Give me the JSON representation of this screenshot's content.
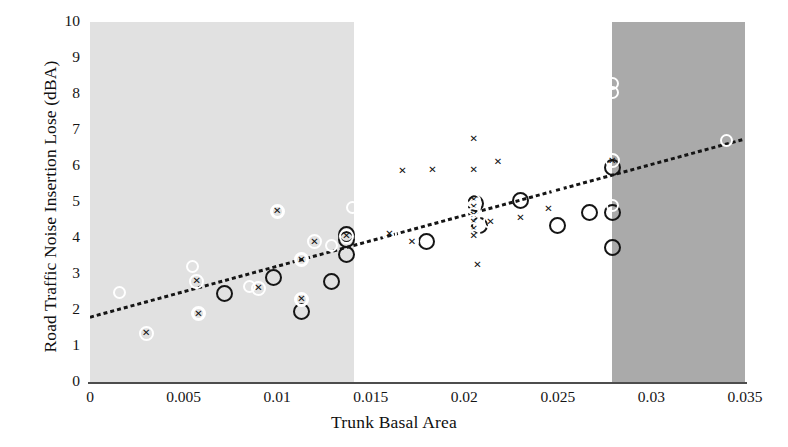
{
  "chart_data": {
    "type": "scatter",
    "title": "",
    "xlabel": "Trunk Basal Area",
    "ylabel": "Road Traffic Noise Insertion Lose (dBA)",
    "xlim": [
      0,
      0.035
    ],
    "ylim": [
      0,
      10
    ],
    "xticks": [
      "0",
      "0.005",
      "0.01",
      "0.015",
      "0.02",
      "0.025",
      "0.03",
      "0.035"
    ],
    "xtick_values": [
      0,
      0.005,
      0.01,
      0.015,
      0.02,
      0.025,
      0.03,
      0.035
    ],
    "yticks": [
      "0",
      "1",
      "2",
      "3",
      "4",
      "5",
      "6",
      "7",
      "8",
      "9",
      "10"
    ],
    "ytick_values": [
      0,
      1,
      2,
      3,
      4,
      5,
      6,
      7,
      8,
      9,
      10
    ],
    "grid": false,
    "legend": "none",
    "background_bands": [
      {
        "name": "light-band",
        "x_start": 0.0,
        "x_end": 0.0141,
        "color": "#e1e1e1"
      },
      {
        "name": "dark-band",
        "x_start": 0.0279,
        "x_end": 0.035,
        "color": "#aaaaaa"
      }
    ],
    "trendline": {
      "type": "dotted-linear",
      "x_start": 0.0,
      "y_start": 1.8,
      "x_end": 0.035,
      "y_end": 6.75,
      "slope": 141.4,
      "intercept": 1.8,
      "color": "#151515"
    },
    "series": [
      {
        "name": "open-black-circle",
        "marker": "large open circle",
        "color": "#151515",
        "points": [
          {
            "x": 0.0072,
            "y": 2.45
          },
          {
            "x": 0.0098,
            "y": 2.9
          },
          {
            "x": 0.0113,
            "y": 1.95
          },
          {
            "x": 0.0129,
            "y": 2.8
          },
          {
            "x": 0.0137,
            "y": 4.1
          },
          {
            "x": 0.0137,
            "y": 3.95
          },
          {
            "x": 0.0137,
            "y": 3.55
          },
          {
            "x": 0.018,
            "y": 3.9
          },
          {
            "x": 0.0206,
            "y": 4.95
          },
          {
            "x": 0.0208,
            "y": 4.35
          },
          {
            "x": 0.023,
            "y": 5.05
          },
          {
            "x": 0.025,
            "y": 4.35
          },
          {
            "x": 0.0267,
            "y": 4.7
          },
          {
            "x": 0.0279,
            "y": 5.95
          },
          {
            "x": 0.0279,
            "y": 4.7
          },
          {
            "x": 0.0279,
            "y": 3.75
          }
        ]
      },
      {
        "name": "open-white-circle",
        "marker": "small light circle",
        "color": "#ffffff",
        "points": [
          {
            "x": 0.0016,
            "y": 2.5
          },
          {
            "x": 0.0055,
            "y": 3.2
          },
          {
            "x": 0.0058,
            "y": 1.9
          },
          {
            "x": 0.0085,
            "y": 2.65
          },
          {
            "x": 0.01,
            "y": 4.75
          },
          {
            "x": 0.0113,
            "y": 2.3
          },
          {
            "x": 0.0113,
            "y": 3.4
          },
          {
            "x": 0.0129,
            "y": 3.8
          },
          {
            "x": 0.014,
            "y": 4.85
          },
          {
            "x": 0.025,
            "y": 5.35
          },
          {
            "x": 0.0279,
            "y": 8.3
          },
          {
            "x": 0.0279,
            "y": 8.05
          },
          {
            "x": 0.0279,
            "y": 4.9
          },
          {
            "x": 0.034,
            "y": 6.7
          }
        ]
      },
      {
        "name": "cross-x",
        "marker": "x",
        "color": "#121212",
        "points": [
          {
            "x": 0.003,
            "y": 1.35
          },
          {
            "x": 0.0057,
            "y": 2.8
          },
          {
            "x": 0.0058,
            "y": 1.9
          },
          {
            "x": 0.009,
            "y": 2.6
          },
          {
            "x": 0.01,
            "y": 4.75
          },
          {
            "x": 0.0113,
            "y": 2.3
          },
          {
            "x": 0.0113,
            "y": 3.4
          },
          {
            "x": 0.012,
            "y": 3.9
          },
          {
            "x": 0.0137,
            "y": 4.05
          },
          {
            "x": 0.0167,
            "y": 5.85
          },
          {
            "x": 0.0183,
            "y": 5.9
          },
          {
            "x": 0.0172,
            "y": 3.9
          },
          {
            "x": 0.016,
            "y": 4.1
          },
          {
            "x": 0.0205,
            "y": 6.75
          },
          {
            "x": 0.0205,
            "y": 5.9
          },
          {
            "x": 0.0218,
            "y": 6.1
          },
          {
            "x": 0.0207,
            "y": 3.25
          },
          {
            "x": 0.0214,
            "y": 4.45
          },
          {
            "x": 0.023,
            "y": 4.55
          },
          {
            "x": 0.0245,
            "y": 4.8
          },
          {
            "x": 0.0279,
            "y": 6.15
          },
          {
            "x": 0.0205,
            "y": 5.05
          },
          {
            "x": 0.0205,
            "y": 4.85
          },
          {
            "x": 0.0205,
            "y": 4.65
          },
          {
            "x": 0.0205,
            "y": 4.45
          },
          {
            "x": 0.0205,
            "y": 4.25
          },
          {
            "x": 0.0205,
            "y": 4.05
          }
        ]
      }
    ]
  }
}
